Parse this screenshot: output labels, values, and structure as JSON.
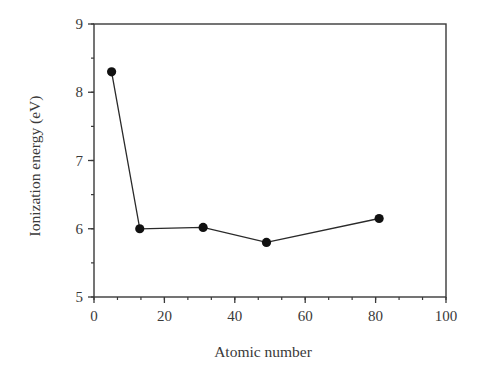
{
  "chart_data": {
    "type": "line",
    "title": "",
    "xlabel": "Atomic number",
    "ylabel": "Ionization energy (eV)",
    "xlim": [
      0,
      100
    ],
    "ylim": [
      5,
      9
    ],
    "x_ticks": [
      0,
      20,
      40,
      60,
      80,
      100
    ],
    "x_tick_labels": [
      "0",
      "20",
      "40",
      "60",
      "80",
      "100"
    ],
    "x_minor_step": 6.6667,
    "y_ticks": [
      5,
      6,
      7,
      8,
      9
    ],
    "y_tick_labels": [
      "5",
      "6",
      "7",
      "8",
      "9"
    ],
    "y_minor_step": 0.5,
    "grid": false,
    "legend": null,
    "markers": "filled-circle",
    "series": [
      {
        "name": "Group 13 elements",
        "x": [
          5,
          13,
          31,
          49,
          81
        ],
        "y": [
          8.3,
          6.0,
          6.02,
          5.8,
          6.15
        ],
        "color": "#1a1a1a"
      }
    ]
  },
  "colors": {
    "axis": "#3a3a3a",
    "line": "#2a2a2a",
    "marker": "#111111",
    "background": "#ffffff"
  }
}
